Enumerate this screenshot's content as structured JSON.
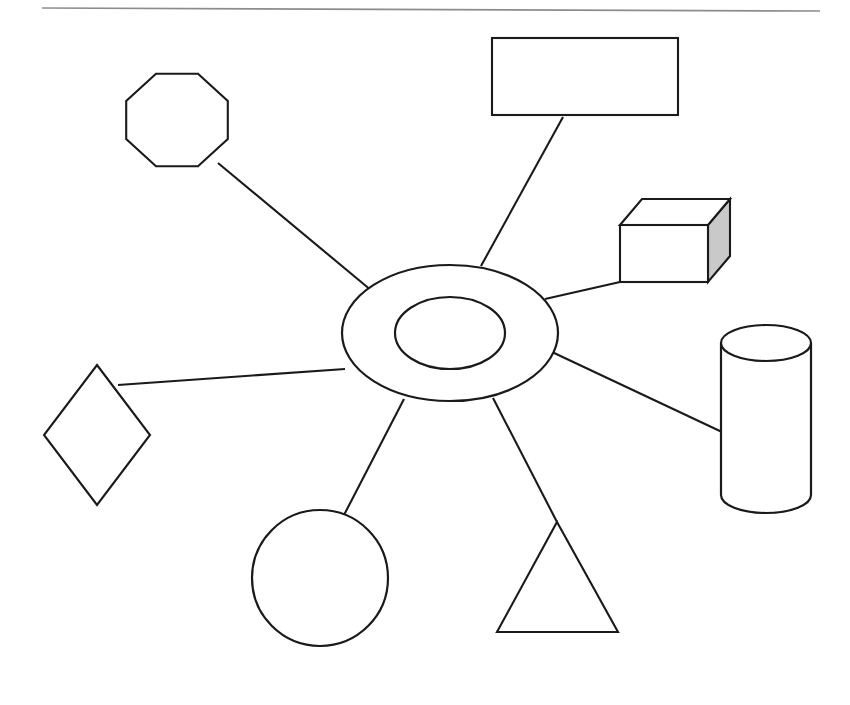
{
  "page": {
    "background_color": "#ffffff",
    "width": 850,
    "height": 705
  },
  "theme": {
    "stroke_color": "#1a1a1a",
    "fill_color": "#ffffff",
    "shade_color": "#c9c9c9",
    "rule_color": "#8c8c8c",
    "stroke_width": 2.1
  },
  "header_rule": {
    "name": "horizontal-divider",
    "x1": 42,
    "y1": 8,
    "x2": 820,
    "y2": 11,
    "color": "#8c8c8c"
  },
  "diagram": {
    "type": "radial-hub-and-spoke",
    "spoke_count": 7,
    "hub": {
      "name": "central-annulus",
      "shape": "double-ellipse",
      "cx": 450,
      "cy": 333,
      "outer_rx": 108,
      "outer_ry": 68,
      "inner_rx": 55,
      "inner_ry": 36
    },
    "nodes": [
      {
        "id": "octagon",
        "label": "octagon",
        "shape": "octagon",
        "cx": 177,
        "cy": 120,
        "rx": 55,
        "ry": 50,
        "shaded": false
      },
      {
        "id": "rectangle",
        "label": "rectangle",
        "shape": "rectangle",
        "x": 492,
        "y": 38,
        "width": 186,
        "height": 77,
        "shaded": false
      },
      {
        "id": "cube",
        "label": "cube",
        "shape": "cube-3d",
        "front_x": 620,
        "front_y": 225,
        "front_width": 88,
        "front_height": 57,
        "depth_x": 22,
        "depth_y": -26,
        "shaded": true,
        "shade_color": "#c9c9c9"
      },
      {
        "id": "cylinder",
        "label": "cylinder",
        "shape": "cylinder",
        "cx": 766,
        "cy": 420,
        "rx": 45,
        "top_y": 343,
        "bottom_y": 495,
        "cap_ry": 18,
        "shaded": false
      },
      {
        "id": "triangle",
        "label": "triangle",
        "shape": "triangle",
        "apex_x": 557,
        "apex_y": 522,
        "left_x": 497,
        "left_y": 632,
        "right_x": 618,
        "right_y": 632,
        "shaded": false
      },
      {
        "id": "circle",
        "label": "circle",
        "shape": "circle",
        "cx": 320,
        "cy": 578,
        "r": 68,
        "shaded": false
      },
      {
        "id": "diamond",
        "label": "diamond",
        "shape": "diamond",
        "cx": 97,
        "cy": 435,
        "rx": 53,
        "ry": 70,
        "shaded": false
      }
    ],
    "connectors": [
      {
        "id": "spoke-octagon",
        "from": "hub",
        "to": "octagon",
        "x1": 372,
        "y1": 291,
        "x2": 218,
        "y2": 163
      },
      {
        "id": "spoke-rectangle",
        "from": "hub",
        "to": "rectangle",
        "x1": 481,
        "y1": 266,
        "x2": 563,
        "y2": 117
      },
      {
        "id": "spoke-cube",
        "from": "hub",
        "to": "cube",
        "x1": 545,
        "y1": 299,
        "x2": 620,
        "y2": 282
      },
      {
        "id": "spoke-cylinder",
        "from": "hub",
        "to": "cylinder",
        "x1": 552,
        "y1": 352,
        "x2": 722,
        "y2": 432
      },
      {
        "id": "spoke-triangle",
        "from": "hub",
        "to": "triangle",
        "x1": 493,
        "y1": 398,
        "x2": 557,
        "y2": 522
      },
      {
        "id": "spoke-circle",
        "from": "hub",
        "to": "circle",
        "x1": 404,
        "y1": 399,
        "x2": 344,
        "y2": 515
      },
      {
        "id": "spoke-diamond",
        "from": "hub",
        "to": "diamond",
        "x1": 345,
        "y1": 369,
        "x2": 118,
        "y2": 385
      }
    ]
  }
}
